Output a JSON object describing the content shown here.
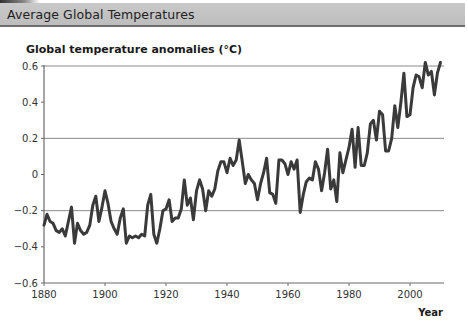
{
  "header": {
    "title": "Average Global Temperatures"
  },
  "chart_data": {
    "type": "line",
    "title": "Global temperature anomalies (°C)",
    "xlabel": "Year",
    "ylabel": "",
    "xlim": [
      1880,
      2010
    ],
    "ylim": [
      -0.6,
      0.6
    ],
    "x_ticks": [
      1880,
      1900,
      1920,
      1940,
      1960,
      1980,
      2000
    ],
    "y_ticks": [
      0.6,
      0.4,
      0.2,
      0,
      -0.2,
      -0.4,
      -0.6
    ],
    "y_tick_labels": [
      "0.6",
      "0.4",
      "0.2",
      "0",
      "−0.2",
      "−0.4",
      "−0.6"
    ],
    "gridlines_y": [
      0.6,
      0.2,
      -0.2
    ],
    "line_color": "#3a3a3a",
    "series": [
      {
        "name": "Global temperature anomaly",
        "x": [
          1880,
          1881,
          1882,
          1883,
          1884,
          1885,
          1886,
          1887,
          1888,
          1889,
          1890,
          1891,
          1892,
          1893,
          1894,
          1895,
          1896,
          1897,
          1898,
          1899,
          1900,
          1901,
          1902,
          1903,
          1904,
          1905,
          1906,
          1907,
          1908,
          1909,
          1910,
          1911,
          1912,
          1913,
          1914,
          1915,
          1916,
          1917,
          1918,
          1919,
          1920,
          1921,
          1922,
          1923,
          1924,
          1925,
          1926,
          1927,
          1928,
          1929,
          1930,
          1931,
          1932,
          1933,
          1934,
          1935,
          1936,
          1937,
          1938,
          1939,
          1940,
          1941,
          1942,
          1943,
          1944,
          1945,
          1946,
          1947,
          1948,
          1949,
          1950,
          1951,
          1952,
          1953,
          1954,
          1955,
          1956,
          1957,
          1958,
          1959,
          1960,
          1961,
          1962,
          1963,
          1964,
          1965,
          1966,
          1967,
          1968,
          1969,
          1970,
          1971,
          1972,
          1973,
          1974,
          1975,
          1976,
          1977,
          1978,
          1979,
          1980,
          1981,
          1982,
          1983,
          1984,
          1985,
          1986,
          1987,
          1988,
          1989,
          1990,
          1991,
          1992,
          1993,
          1994,
          1995,
          1996,
          1997,
          1998,
          1999,
          2000,
          2001,
          2002,
          2003,
          2004,
          2005,
          2006,
          2007,
          2008,
          2009,
          2010
        ],
        "values": [
          -0.28,
          -0.22,
          -0.26,
          -0.27,
          -0.31,
          -0.32,
          -0.3,
          -0.34,
          -0.26,
          -0.18,
          -0.38,
          -0.27,
          -0.31,
          -0.33,
          -0.32,
          -0.28,
          -0.17,
          -0.12,
          -0.26,
          -0.18,
          -0.09,
          -0.16,
          -0.26,
          -0.3,
          -0.33,
          -0.24,
          -0.19,
          -0.38,
          -0.34,
          -0.35,
          -0.34,
          -0.35,
          -0.33,
          -0.34,
          -0.17,
          -0.11,
          -0.33,
          -0.38,
          -0.3,
          -0.2,
          -0.19,
          -0.14,
          -0.26,
          -0.24,
          -0.24,
          -0.19,
          -0.03,
          -0.17,
          -0.13,
          -0.25,
          -0.09,
          -0.03,
          -0.08,
          -0.2,
          -0.09,
          -0.12,
          -0.08,
          0.02,
          0.07,
          0.07,
          0.01,
          0.09,
          0.05,
          0.08,
          0.19,
          0.07,
          -0.05,
          0.0,
          -0.03,
          -0.05,
          -0.14,
          -0.05,
          0.01,
          0.09,
          -0.1,
          -0.11,
          -0.16,
          0.08,
          0.08,
          0.06,
          0.0,
          0.07,
          0.03,
          0.08,
          -0.21,
          -0.11,
          -0.04,
          -0.02,
          -0.03,
          0.07,
          0.03,
          -0.09,
          0.01,
          0.14,
          -0.08,
          -0.03,
          -0.15,
          0.12,
          0.01,
          0.08,
          0.15,
          0.25,
          0.04,
          0.26,
          0.05,
          0.05,
          0.12,
          0.28,
          0.3,
          0.19,
          0.35,
          0.33,
          0.13,
          0.13,
          0.2,
          0.38,
          0.26,
          0.4,
          0.56,
          0.32,
          0.33,
          0.48,
          0.55,
          0.54,
          0.48,
          0.62,
          0.55,
          0.57,
          0.44,
          0.56,
          0.62
        ]
      }
    ],
    "legend": null,
    "grid": "partial horizontal"
  }
}
